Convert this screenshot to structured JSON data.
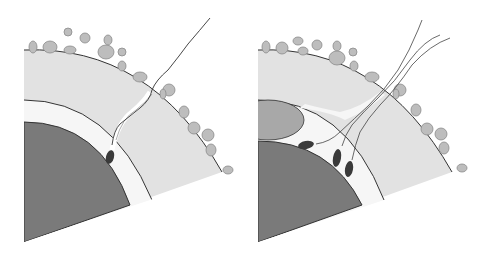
{
  "figure": {
    "colors": {
      "background": "#ffffff",
      "zona": "#e2e2e2",
      "perivitelline": "#f4f4f4",
      "ooplasm": "#7a7a7a",
      "polar_body": "#a8a8a8",
      "cumulus_cell": "#bdbdbd",
      "cumulus_stroke": "#8a8a8a",
      "sperm_head": "#3a3a3a",
      "outline": "#333333",
      "tail": "#444444"
    },
    "panels": [
      {
        "id": "left",
        "sperm_count": 1
      },
      {
        "id": "right",
        "sperm_count": 3
      }
    ]
  }
}
